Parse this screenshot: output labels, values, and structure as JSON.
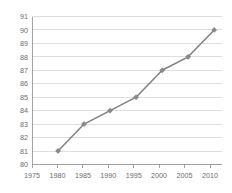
{
  "chart_data": {
    "type": "line",
    "title": "",
    "subtitle": "",
    "xlabel": "",
    "ylabel": "",
    "x": [
      1980,
      1985,
      1990,
      1995,
      2000,
      2005,
      2010
    ],
    "values": [
      81,
      83,
      84,
      85,
      87,
      88,
      90
    ],
    "series": [
      {
        "name": "",
        "values": [
          81,
          83,
          84,
          85,
          87,
          88,
          90
        ]
      }
    ],
    "xlim": [
      1975,
      2011.5
    ],
    "ylim": [
      80,
      91
    ],
    "x_ticks": [
      1975,
      1980,
      1985,
      1990,
      1995,
      2000,
      2005,
      2010
    ],
    "x_tick_labels": [
      "1975",
      "1980",
      "1985",
      "1990",
      "1995",
      "2000",
      "2005",
      "2010"
    ],
    "y_ticks": [
      80,
      81,
      82,
      83,
      84,
      85,
      86,
      87,
      88,
      89,
      90,
      91
    ],
    "y_tick_labels": [
      "80",
      "81",
      "82",
      "83",
      "84",
      "85",
      "86",
      "87",
      "88",
      "89",
      "90",
      "91"
    ],
    "grid": "horizontal",
    "legend": "none",
    "annotations": [],
    "colors": {
      "line": "#808080",
      "marker": "#8a8a8a",
      "gridline": "#d0d0d0",
      "axis": "#9a9a9a",
      "tick_text": "#6b6b6b",
      "background": "#ffffff"
    },
    "marker_style": "diamond"
  }
}
